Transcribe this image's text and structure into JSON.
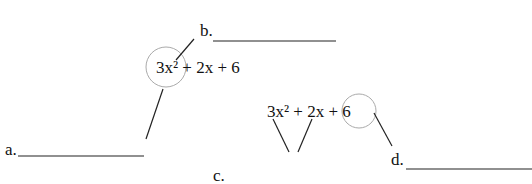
{
  "diagram": {
    "expression_top": "3x² + 2x + 6",
    "expression_bottom": "3x² + 2x + 6",
    "labels": {
      "a": "a.",
      "b": "b.",
      "c": "c.",
      "d": "d."
    },
    "colors": {
      "line": "#222222",
      "circle": "#aaaaaa"
    }
  }
}
